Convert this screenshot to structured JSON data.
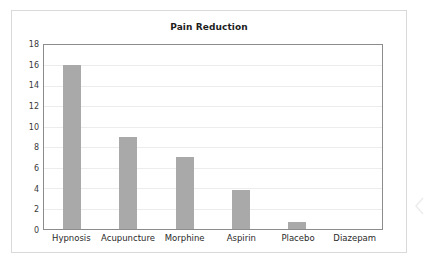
{
  "chart_data": {
    "type": "bar",
    "title": "Pain Reduction",
    "xlabel": "",
    "ylabel": "",
    "categories": [
      "Hypnosis",
      "Acupuncture",
      "Morphine",
      "Aspirin",
      "Placebo",
      "Diazepam"
    ],
    "values": [
      16,
      9,
      7,
      3.8,
      0.7,
      0
    ],
    "ylim": [
      0,
      18
    ],
    "yticks": [
      0,
      2,
      4,
      6,
      8,
      10,
      12,
      14,
      16,
      18
    ],
    "ytick_labels": [
      "0",
      "2",
      "4",
      "6",
      "8",
      "10",
      "12",
      "14",
      "16",
      "18"
    ],
    "grid": true,
    "legend": false,
    "legend_position": "none",
    "bar_color": "#a9a9a9",
    "series": [
      {
        "name": "Pain Reduction",
        "values": [
          16,
          9,
          7,
          3.8,
          0.7,
          0
        ]
      }
    ]
  },
  "card": {
    "border_color": "#d9d9d9",
    "background": "#ffffff"
  },
  "axes": {
    "frame_color": "#8c8c8c",
    "gridline_color": "#ececec"
  },
  "decoration": {
    "edge_chevron": "chevron-left-artifact"
  }
}
